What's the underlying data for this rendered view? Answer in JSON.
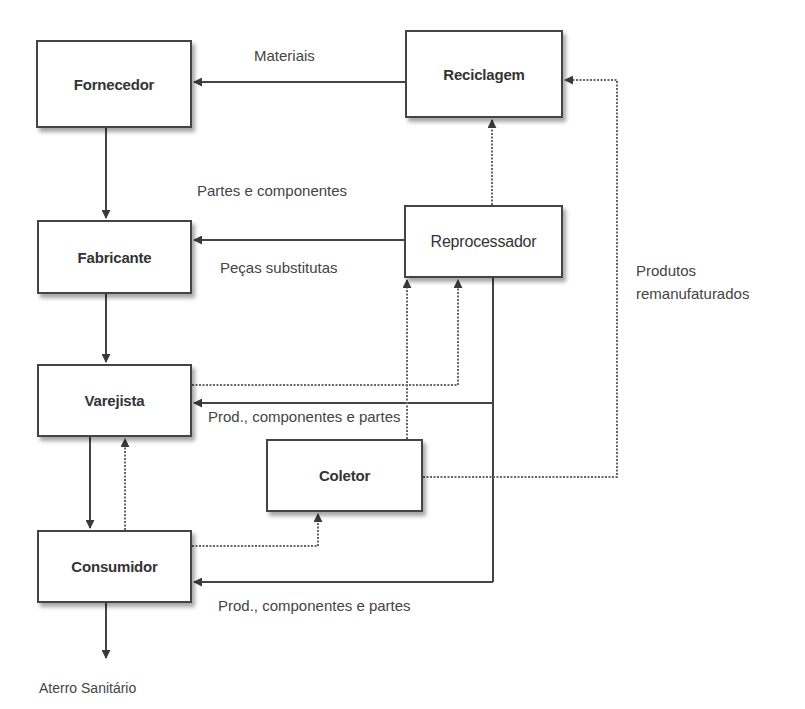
{
  "diagram": {
    "colors": {
      "line": "#444444",
      "dotted": "#666666",
      "box_border": "#444444",
      "text": "#3a3a3a"
    },
    "nodes": {
      "fornecedor": {
        "label": "Fornecedor"
      },
      "fabricante": {
        "label": "Fabricante"
      },
      "varejista": {
        "label": "Varejista"
      },
      "consumidor": {
        "label": "Consumidor"
      },
      "reciclagem": {
        "label": "Reciclagem"
      },
      "reprocessador": {
        "label": "Reprocessador"
      },
      "coletor": {
        "label": "Coletor"
      }
    },
    "edge_labels": {
      "materiais": "Materiais",
      "partes_componentes": "Partes e componentes",
      "pecas_substitutas": "Peças substitutas",
      "produtos_remanufaturados_line1": "Produtos",
      "produtos_remanufaturados_line2": "remanufaturados",
      "prod_comp_partes_varejista": "Prod., componentes e partes",
      "prod_comp_partes_consumidor": "Prod., componentes e partes",
      "aterro": "Aterro Sanitário"
    },
    "edges": [
      {
        "from": "Reciclagem",
        "to": "Fornecedor",
        "style": "solid",
        "label": "Materiais"
      },
      {
        "from": "Fornecedor",
        "to": "Fabricante",
        "style": "solid"
      },
      {
        "from": "Reprocessador",
        "to": "Fabricante",
        "style": "solid",
        "label": "Partes e componentes / Peças substitutas"
      },
      {
        "from": "Fabricante",
        "to": "Varejista",
        "style": "solid"
      },
      {
        "from": "Varejista",
        "to": "Consumidor",
        "style": "solid"
      },
      {
        "from": "Consumidor",
        "to": "Varejista",
        "style": "dotted"
      },
      {
        "from": "Varejista",
        "to": "Reprocessador",
        "style": "dotted"
      },
      {
        "from": "Reprocessador",
        "to": "Varejista",
        "style": "solid",
        "label": "Prod., componentes e partes"
      },
      {
        "from": "Reprocessador",
        "to": "Consumidor",
        "style": "solid",
        "label": "Prod., componentes e partes"
      },
      {
        "from": "Reprocessador",
        "to": "Reciclagem",
        "style": "dotted"
      },
      {
        "from": "Coletor",
        "to": "Reprocessador",
        "style": "dotted"
      },
      {
        "from": "Coletor",
        "to": "Reciclagem",
        "style": "dotted",
        "label": "Produtos remanufaturados"
      },
      {
        "from": "Consumidor",
        "to": "Coletor",
        "style": "dotted"
      },
      {
        "from": "Consumidor",
        "to": "Aterro Sanitário",
        "style": "solid"
      }
    ]
  }
}
